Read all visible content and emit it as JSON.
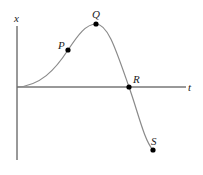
{
  "diagram": {
    "type": "position-time graph",
    "axes": {
      "vertical_label": "x",
      "horizontal_label": "t"
    },
    "points": [
      {
        "label": "P",
        "x": 68,
        "y": 50
      },
      {
        "label": "Q",
        "x": 96,
        "y": 24
      },
      {
        "label": "R",
        "x": 129,
        "y": 87
      },
      {
        "label": "S",
        "x": 153,
        "y": 150
      }
    ],
    "colors": {
      "axis": "#333333",
      "curve": "#8a8a8a",
      "point": "#000000"
    }
  }
}
